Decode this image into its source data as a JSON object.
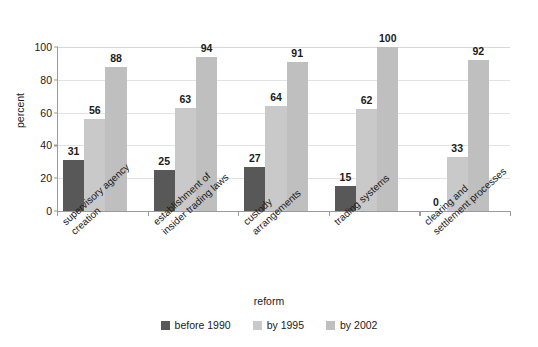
{
  "chart_data": {
    "type": "bar",
    "title": "",
    "xlabel": "reform",
    "ylabel": "percent",
    "ylim": [
      0,
      100
    ],
    "yticks": [
      0,
      20,
      40,
      60,
      80,
      100
    ],
    "grid": true,
    "legend_position": "bottom-center",
    "categories": [
      "supervisory agency creation",
      "establishment of insider trading laws",
      "custody arrangements",
      "trading systems",
      "clearing and settlement processes"
    ],
    "category_lines": [
      [
        "supervisory agency",
        "creation"
      ],
      [
        "establishment of",
        "insider trading laws"
      ],
      [
        "custody",
        "arrangements"
      ],
      [
        "trading systems"
      ],
      [
        "clearing and",
        "settlement processes"
      ]
    ],
    "series": [
      {
        "name": "before 1990",
        "color": "#585858",
        "values": [
          31,
          25,
          27,
          15,
          0
        ]
      },
      {
        "name": "by 1995",
        "color": "#c9c9c9",
        "values": [
          56,
          63,
          64,
          62,
          33
        ]
      },
      {
        "name": "by 2002",
        "color": "#bfbfbf",
        "values": [
          88,
          94,
          91,
          100,
          92
        ]
      }
    ]
  },
  "axes": {
    "y_title": "percent",
    "x_title": "reform",
    "y_tick_labels": [
      "0",
      "20",
      "40",
      "60",
      "80",
      "100"
    ]
  },
  "legend": {
    "items": [
      {
        "label": "before 1990",
        "color": "#585858"
      },
      {
        "label": "by 1995",
        "color": "#c9c9c9"
      },
      {
        "label": "by 2002",
        "color": "#bfbfbf"
      }
    ]
  }
}
